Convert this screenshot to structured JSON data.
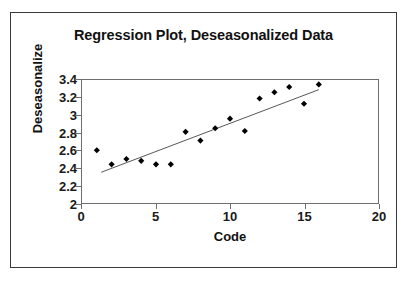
{
  "chart_data": {
    "type": "scatter",
    "title": "Regression Plot, Deseasonalized Data",
    "xlabel": "Code",
    "ylabel": "Deseasonalize",
    "xlim": [
      0,
      20
    ],
    "ylim": [
      2,
      3.4
    ],
    "xticks": [
      0,
      5,
      10,
      15,
      20
    ],
    "xtick_labels": [
      "0",
      "5",
      "10",
      "15",
      "20"
    ],
    "yticks": [
      2,
      2.2,
      2.4,
      2.6,
      2.8,
      3,
      3.2,
      3.4
    ],
    "ytick_labels": [
      "2",
      "2.2",
      "2.4",
      "2.6",
      "2.8",
      "3",
      "3.2",
      "3.4"
    ],
    "grid": false,
    "legend": false,
    "marker": "diamond",
    "marker_color": "#000000",
    "trendline_color": "#555555",
    "series": [
      {
        "name": "Deseasonalize",
        "x": [
          1,
          2,
          3,
          4,
          5,
          6,
          7,
          8,
          9,
          10,
          11,
          12,
          13,
          14,
          15,
          16
        ],
        "y": [
          2.6,
          2.44,
          2.5,
          2.48,
          2.44,
          2.44,
          2.81,
          2.71,
          2.85,
          2.96,
          2.82,
          3.19,
          3.26,
          3.32,
          3.13,
          3.35
        ]
      }
    ],
    "trendline": {
      "x_start": 1.3,
      "y_start": 2.35,
      "x_end": 16.0,
      "y_end": 3.29
    }
  },
  "frame": {
    "border_color": "#3a3a3a",
    "background": "#ffffff"
  }
}
